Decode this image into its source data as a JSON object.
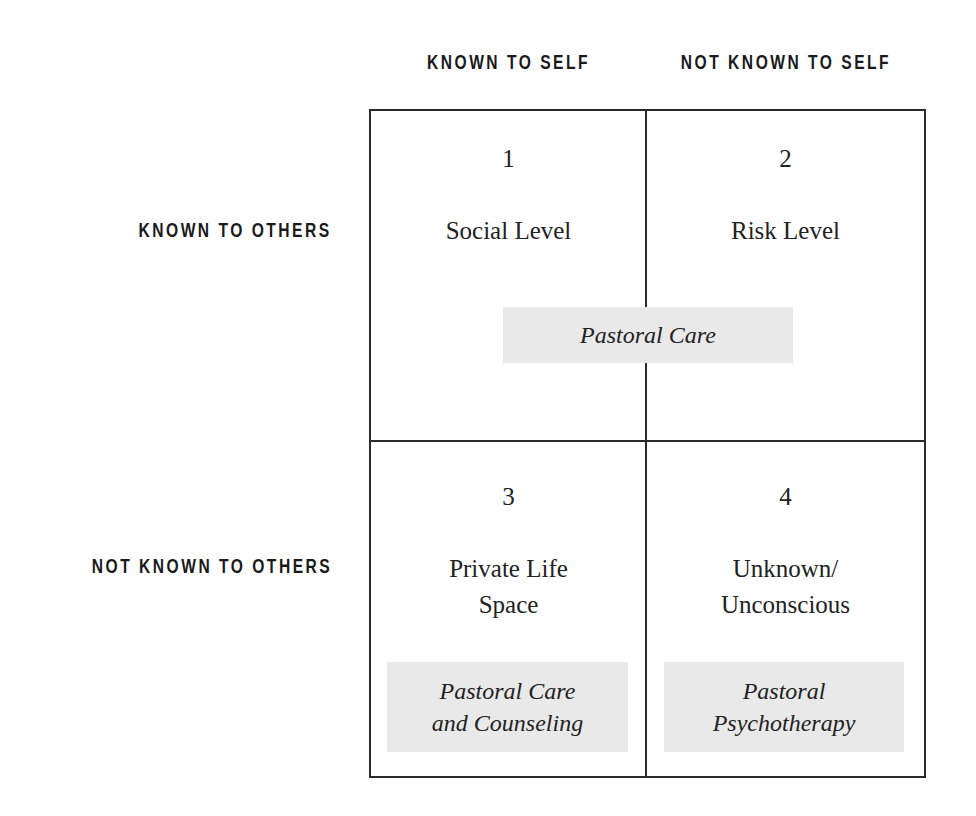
{
  "column_headers": [
    "KNOWN TO SELF",
    "NOT KNOWN TO SELF"
  ],
  "row_headers": [
    "KNOWN TO OTHERS",
    "NOT KNOWN TO OTHERS"
  ],
  "cells": [
    {
      "number": "1",
      "title": "Social Level"
    },
    {
      "number": "2",
      "title": "Risk Level"
    },
    {
      "number": "3",
      "title_line1": "Private Life",
      "title_line2": "Space"
    },
    {
      "number": "4",
      "title_line1": "Unknown/",
      "title_line2": "Unconscious"
    }
  ],
  "care_labels": {
    "top_spanning": "Pastoral Care",
    "bottom_left_line1": "Pastoral Care",
    "bottom_left_line2": "and Counseling",
    "bottom_right_line1": "Pastoral",
    "bottom_right_line2": "Psychotherapy"
  },
  "colors": {
    "line": "#2a2a2a",
    "shade": "#e9e9e9",
    "text": "#222222"
  }
}
